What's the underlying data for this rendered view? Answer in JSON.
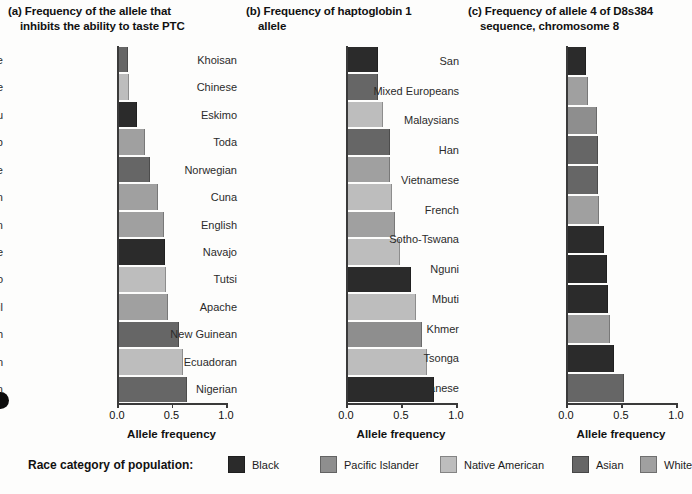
{
  "figure": {
    "axis_title": "Allele frequency",
    "xticks": [
      "0.0",
      "0.5",
      "1.0"
    ],
    "xlim": [
      0,
      1
    ]
  },
  "legend": {
    "title": "Race category of population:",
    "items": [
      {
        "label": "Black",
        "color": "#2b2b2b"
      },
      {
        "label": "Pacific Islander",
        "color": "#8e8e8e"
      },
      {
        "label": "Native American",
        "color": "#bdbdbd"
      },
      {
        "label": "Asian",
        "color": "#666666"
      },
      {
        "label": "White",
        "color": "#a0a0a0"
      }
    ]
  },
  "panels": [
    {
      "letter": "(a)",
      "title_line1": "Frequency of the allele that",
      "title_line2": "inhibits the ability to taste PTC"
    },
    {
      "letter": "(b)",
      "title_line1": "Frequency of haptoglobin 1",
      "title_line2": "allele"
    },
    {
      "letter": "(c)",
      "title_line1": "Frequency of allele 4 of D8s384",
      "title_line2": "sequence, chromosome 8"
    }
  ],
  "chart_data": [
    {
      "type": "bar",
      "orientation": "horizontal",
      "panel": "(a)",
      "title": "(a) Frequency of the allele that inhibits the ability to taste PTC",
      "xlabel": "Allele frequency",
      "ylabel": "",
      "xlim": [
        0,
        1
      ],
      "xticks": [
        0.0,
        0.5,
        1.0
      ],
      "grid": false,
      "legend_position": "bottom",
      "categories": [
        "Taiwanese",
        "Cree",
        "Bantu",
        "Lapp",
        "Japanese",
        "Malaysian",
        "Belgian",
        "Sudanese",
        "Eskimo",
        "Tamil",
        "English",
        "Venezuelan Indian",
        "Bombay Indian"
      ],
      "values": [
        0.09,
        0.1,
        0.17,
        0.25,
        0.29,
        0.37,
        0.42,
        0.43,
        0.44,
        0.46,
        0.56,
        0.6,
        0.63
      ],
      "race_category": [
        "Asian",
        "Native American",
        "Black",
        "White",
        "Asian",
        "White",
        "White",
        "Black",
        "Native American",
        "White",
        "Asian",
        "Native American",
        "Asian"
      ]
    },
    {
      "type": "bar",
      "orientation": "horizontal",
      "panel": "(b)",
      "title": "(b) Frequency of haptoglobin 1 allele",
      "xlabel": "Allele frequency",
      "ylabel": "",
      "xlim": [
        0,
        1
      ],
      "xticks": [
        0.0,
        0.5,
        1.0
      ],
      "grid": false,
      "legend_position": "bottom",
      "categories": [
        "Khoisan",
        "Chinese",
        "Eskimo",
        "Toda",
        "Norwegian",
        "Cuna",
        "English",
        "Navajo",
        "Tutsi",
        "Apache",
        "New Guinean",
        "Ecuadoran",
        "Nigerian"
      ],
      "values": [
        0.28,
        0.28,
        0.33,
        0.39,
        0.39,
        0.41,
        0.44,
        0.48,
        0.58,
        0.63,
        0.68,
        0.73,
        0.79
      ],
      "race_category": [
        "Black",
        "Asian",
        "Native American",
        "Asian",
        "White",
        "Native American",
        "White",
        "Native American",
        "Black",
        "Native American",
        "Pacific Islander",
        "Native American",
        "Black"
      ]
    },
    {
      "type": "bar",
      "orientation": "horizontal",
      "panel": "(c)",
      "title": "(c) Frequency of allele 4 of D8s384 sequence, chromosome 8",
      "xlabel": "Allele frequency",
      "ylabel": "",
      "xlim": [
        0,
        1
      ],
      "xticks": [
        0.0,
        0.5,
        1.0
      ],
      "grid": false,
      "legend_position": "bottom",
      "categories": [
        "San",
        "Mixed Europeans",
        "Malaysians",
        "Han",
        "Vietnamese",
        "French",
        "Sotho-Tswana",
        "Nguni",
        "Mbuti",
        "Khmer",
        "Tsonga",
        "Japanese"
      ],
      "values": [
        0.17,
        0.19,
        0.27,
        0.28,
        0.28,
        0.29,
        0.34,
        0.36,
        0.37,
        0.39,
        0.43,
        0.52
      ],
      "race_category": [
        "Black",
        "White",
        "Pacific Islander",
        "Asian",
        "Asian",
        "White",
        "Black",
        "Black",
        "Black",
        "White",
        "Black",
        "Asian"
      ]
    }
  ]
}
